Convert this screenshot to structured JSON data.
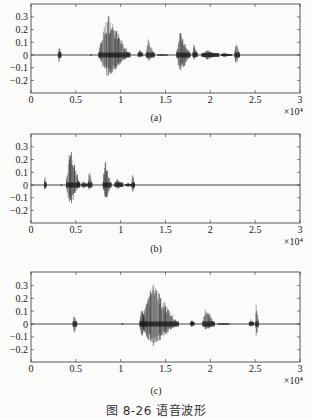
{
  "figure": {
    "caption": "图 8-26   语音波形",
    "colors": {
      "waveform": "#1a1a1a",
      "waveform_light": "#6a6a6a",
      "axis": "#333333",
      "background": "#fbfbf9"
    }
  },
  "chart_data": [
    {
      "type": "line",
      "panel_label": "(a)",
      "title": "",
      "xlabel": "",
      "ylabel": "",
      "x_multiplier": "×10⁴",
      "xlim": [
        0,
        3
      ],
      "ylim": [
        -0.3,
        0.4
      ],
      "xticks": [
        "0",
        "0.5",
        "1",
        "1.5",
        "2",
        "2.5",
        "3"
      ],
      "yticks": [
        "0.3",
        "0.2",
        "0.1",
        "0",
        "−0.1",
        "−0.2"
      ],
      "grid": false,
      "signal_extent": [
        0.3,
        2.4
      ],
      "bursts": [
        {
          "center": 0.32,
          "width": 0.04,
          "pos": 0.08,
          "neg": -0.07
        },
        {
          "center": 0.67,
          "width": 0.02,
          "pos": 0.01,
          "neg": -0.01
        },
        {
          "center": 0.93,
          "width": 0.36,
          "pos": 0.33,
          "neg": -0.18
        },
        {
          "center": 1.22,
          "width": 0.06,
          "pos": 0.05,
          "neg": -0.03
        },
        {
          "center": 1.33,
          "width": 0.1,
          "pos": 0.13,
          "neg": -0.05
        },
        {
          "center": 1.47,
          "width": 0.12,
          "pos": 0.01,
          "neg": -0.01
        },
        {
          "center": 1.7,
          "width": 0.16,
          "pos": 0.2,
          "neg": -0.15
        },
        {
          "center": 1.83,
          "width": 0.06,
          "pos": 0.09,
          "neg": -0.04
        },
        {
          "center": 2.0,
          "width": 0.2,
          "pos": 0.04,
          "neg": -0.04
        },
        {
          "center": 2.18,
          "width": 0.12,
          "pos": 0.02,
          "neg": -0.02
        },
        {
          "center": 2.3,
          "width": 0.06,
          "pos": 0.12,
          "neg": -0.09
        }
      ]
    },
    {
      "type": "line",
      "panel_label": "(b)",
      "title": "",
      "xlabel": "",
      "ylabel": "",
      "x_multiplier": "×10⁴",
      "xlim": [
        0,
        3
      ],
      "ylim": [
        -0.3,
        0.4
      ],
      "xticks": [
        "0",
        "0.5",
        "1",
        "1.5",
        "2",
        "2.5",
        "3"
      ],
      "yticks": [
        "0.3",
        "0.2",
        "0.1",
        "0",
        "−0.1",
        "−0.2"
      ],
      "grid": false,
      "signal_extent": [
        0.15,
        1.2
      ],
      "bursts": [
        {
          "center": 0.16,
          "width": 0.03,
          "pos": 0.07,
          "neg": -0.06
        },
        {
          "center": 0.34,
          "width": 0.02,
          "pos": 0.01,
          "neg": -0.01
        },
        {
          "center": 0.47,
          "width": 0.16,
          "pos": 0.33,
          "neg": -0.18
        },
        {
          "center": 0.6,
          "width": 0.08,
          "pos": 0.03,
          "neg": -0.03
        },
        {
          "center": 0.66,
          "width": 0.05,
          "pos": 0.13,
          "neg": -0.05
        },
        {
          "center": 0.85,
          "width": 0.1,
          "pos": 0.2,
          "neg": -0.14
        },
        {
          "center": 0.98,
          "width": 0.1,
          "pos": 0.05,
          "neg": -0.04
        },
        {
          "center": 1.1,
          "width": 0.1,
          "pos": 0.02,
          "neg": -0.02
        },
        {
          "center": 1.14,
          "width": 0.04,
          "pos": 0.11,
          "neg": -0.07
        }
      ]
    },
    {
      "type": "line",
      "panel_label": "(c)",
      "title": "",
      "xlabel": "",
      "ylabel": "",
      "x_multiplier": "×10⁴",
      "xlim": [
        0,
        3
      ],
      "ylim": [
        -0.3,
        0.4
      ],
      "xticks": [
        "0",
        "0.5",
        "1",
        "1.5",
        "2",
        "2.5",
        "3"
      ],
      "yticks": [
        "0.3",
        "0.2",
        "0.1",
        "0",
        "−0.1",
        "−0.2"
      ],
      "grid": false,
      "signal_extent": [
        0.48,
        2.54
      ],
      "bursts": [
        {
          "center": 0.49,
          "width": 0.05,
          "pos": 0.09,
          "neg": -0.09
        },
        {
          "center": 1.02,
          "width": 0.02,
          "pos": 0.01,
          "neg": -0.01
        },
        {
          "center": 1.25,
          "width": 0.08,
          "pos": 0.15,
          "neg": -0.13
        },
        {
          "center": 1.44,
          "width": 0.42,
          "pos": 0.33,
          "neg": -0.19
        },
        {
          "center": 1.8,
          "width": 0.05,
          "pos": 0.04,
          "neg": -0.03
        },
        {
          "center": 1.98,
          "width": 0.14,
          "pos": 0.14,
          "neg": -0.06
        },
        {
          "center": 2.15,
          "width": 0.14,
          "pos": 0.01,
          "neg": -0.01
        },
        {
          "center": 2.46,
          "width": 0.06,
          "pos": 0.04,
          "neg": -0.03
        },
        {
          "center": 2.52,
          "width": 0.04,
          "pos": 0.19,
          "neg": -0.11
        }
      ]
    }
  ]
}
